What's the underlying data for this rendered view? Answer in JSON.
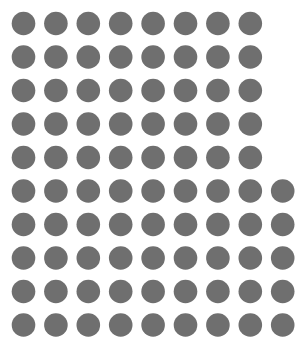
{
  "chart_data": {
    "type": "scatter",
    "subtype": "dot-grid",
    "title": "",
    "xlabel": "",
    "ylabel": "",
    "total_count": 85,
    "rows": [
      {
        "row": 1,
        "count": 8
      },
      {
        "row": 2,
        "count": 8
      },
      {
        "row": 3,
        "count": 8
      },
      {
        "row": 4,
        "count": 8
      },
      {
        "row": 5,
        "count": 8
      },
      {
        "row": 6,
        "count": 9
      },
      {
        "row": 7,
        "count": 9
      },
      {
        "row": 8,
        "count": 9
      },
      {
        "row": 9,
        "count": 9
      },
      {
        "row": 10,
        "count": 9
      }
    ],
    "dot_color": "#6f6f6f",
    "background_color": "#ffffff",
    "grid": false,
    "legend": "none"
  }
}
